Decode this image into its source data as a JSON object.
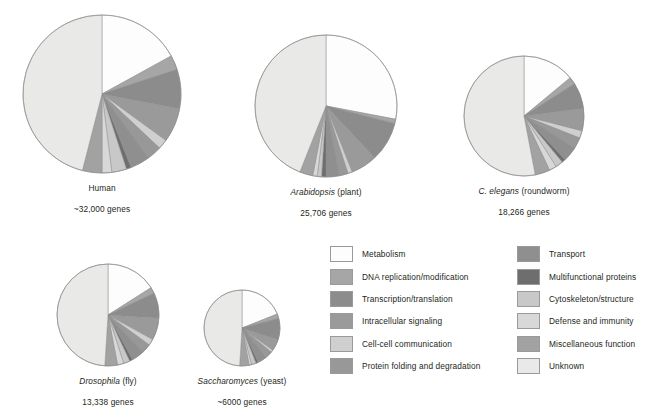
{
  "chart_data": {
    "type": "pie",
    "categories": [
      "Metabolism",
      "DNA replication/modification",
      "Transcription/translation",
      "Intracellular signaling",
      "Cell-cell communication",
      "Protein folding and degradation",
      "Transport",
      "Multifunctional proteins",
      "Cytoskeleton/structure",
      "Defense and immunity",
      "Miscellaneous function",
      "Unknown"
    ],
    "colors": [
      "#fdfdfd",
      "#a6a6a6",
      "#8c8c8c",
      "#9a9a9a",
      "#cfcfcf",
      "#989898",
      "#8f8f8f",
      "#6e6e6e",
      "#c8c8c8",
      "#d8d8d8",
      "#a2a2a2",
      "#e9e9e7"
    ],
    "legend_position": "bottom-center",
    "series": [
      {
        "name": "Human",
        "values": [
          17,
          3,
          8,
          7,
          2,
          3,
          4,
          1,
          3,
          2,
          4,
          46
        ]
      },
      {
        "name": "Arabidopsis",
        "values": [
          28,
          1,
          9,
          6,
          1,
          2,
          3,
          1,
          1,
          1,
          3,
          44
        ]
      },
      {
        "name": "C. elegans",
        "values": [
          14,
          2,
          7,
          6,
          2,
          3,
          4,
          1,
          2,
          2,
          4,
          53
        ]
      },
      {
        "name": "Drosophila",
        "values": [
          16,
          2,
          8,
          7,
          2,
          3,
          4,
          1,
          2,
          2,
          4,
          49
        ]
      },
      {
        "name": "Saccharomyces",
        "values": [
          19,
          2,
          9,
          5,
          1,
          3,
          4,
          1,
          2,
          1,
          4,
          49
        ]
      }
    ]
  },
  "organisms": [
    {
      "id": "human",
      "species": "",
      "common": "Human",
      "genes": "~32,000 genes",
      "radius": 78
    },
    {
      "id": "arabidopsis",
      "species": "Arabidopsis",
      "common": "(plant)",
      "genes": "25,706 genes",
      "radius": 70
    },
    {
      "id": "celegans",
      "species": "C. elegans",
      "common": "(roundworm)",
      "genes": "18,266 genes",
      "radius": 59
    },
    {
      "id": "drosophila",
      "species": "Drosophila",
      "common": "(fly)",
      "genes": "13,338  genes",
      "radius": 50
    },
    {
      "id": "saccharomyces",
      "species": "Saccharomyces",
      "common": "(yeast)",
      "genes": "~6000  genes",
      "radius": 38
    }
  ],
  "legend": {
    "left_column": [
      {
        "label": "Metabolism",
        "color": "#fdfdfd"
      },
      {
        "label": "DNA replication/modification",
        "color": "#a6a6a6"
      },
      {
        "label": "Transcription/translation",
        "color": "#8c8c8c"
      },
      {
        "label": "Intracellular signaling",
        "color": "#9a9a9a"
      },
      {
        "label": "Cell-cell communication",
        "color": "#cfcfcf"
      },
      {
        "label": "Protein folding and degradation",
        "color": "#989898"
      }
    ],
    "right_column": [
      {
        "label": "Transport",
        "color": "#8f8f8f"
      },
      {
        "label": "Multifunctional proteins",
        "color": "#6e6e6e"
      },
      {
        "label": "Cytoskeleton/structure",
        "color": "#c8c8c8"
      },
      {
        "label": "Defense and immunity",
        "color": "#d8d8d8"
      },
      {
        "label": "Miscellaneous function",
        "color": "#a2a2a2"
      },
      {
        "label": "Unknown",
        "color": "#e9e9e7"
      }
    ]
  }
}
